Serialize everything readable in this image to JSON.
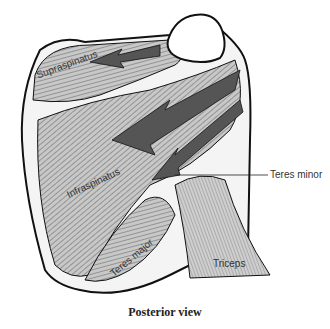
{
  "figure": {
    "caption": "Posterior view",
    "labels": {
      "supraspinatus": "Supraspinatus",
      "infraspinatus": "Infraspinatus",
      "teres_minor": "Teres minor",
      "teres_major": "Teres major",
      "triceps": "Triceps"
    },
    "colors": {
      "muscle_fill": "#bdbdbd",
      "arrow_fill": "#555555",
      "outline": "#111111",
      "bone": "#ffffff"
    }
  }
}
